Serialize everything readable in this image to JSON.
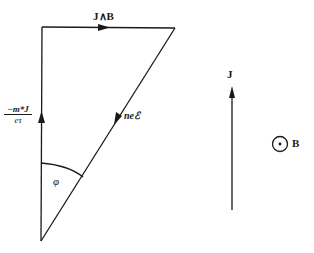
{
  "diagram": {
    "labels": {
      "top_vector": "J∧B",
      "left_vector_num": "−m*J",
      "left_vector_den": "eτ",
      "diagonal_vector": "neℰ",
      "angle": "φ",
      "current": "J",
      "field": "B"
    },
    "colors": {
      "ink": "#1a1a1a",
      "background": "#ffffff"
    }
  }
}
